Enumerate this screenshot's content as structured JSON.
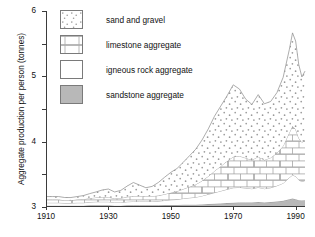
{
  "chart_data": {
    "type": "area",
    "title": "",
    "subtitle": "",
    "xlabel": "",
    "ylabel": "Aggregate production per person (tonnes)",
    "xlim": [
      1910,
      1993
    ],
    "ylim": [
      0,
      6
    ],
    "yticks": [
      0,
      1,
      2,
      3,
      4,
      5,
      6
    ],
    "xticks": [
      1910,
      1930,
      1950,
      1970,
      1990
    ],
    "xtick_labels": [
      "1910",
      "1930",
      "1950",
      "1970",
      "1990"
    ],
    "ytick_labels": [
      "0",
      "1",
      "2",
      "3",
      "4",
      "5",
      "6"
    ],
    "grid": false,
    "stacked": true,
    "legend_position": "upper-left-inside",
    "x": [
      1910,
      1912,
      1914,
      1916,
      1918,
      1920,
      1922,
      1924,
      1926,
      1928,
      1930,
      1932,
      1934,
      1936,
      1938,
      1940,
      1942,
      1944,
      1946,
      1948,
      1950,
      1952,
      1954,
      1956,
      1958,
      1960,
      1962,
      1964,
      1966,
      1968,
      1970,
      1972,
      1974,
      1976,
      1978,
      1980,
      1982,
      1984,
      1986,
      1988,
      1989,
      1990,
      1991,
      1992,
      1993
    ],
    "series": [
      {
        "name": "sandstone aggregate",
        "fill": "#b8b8b8",
        "pattern": "solid-grey",
        "order": 1,
        "values": [
          0.04,
          0.04,
          0.04,
          0.04,
          0.04,
          0.04,
          0.04,
          0.05,
          0.05,
          0.05,
          0.05,
          0.04,
          0.04,
          0.05,
          0.05,
          0.05,
          0.05,
          0.05,
          0.05,
          0.06,
          0.06,
          0.06,
          0.07,
          0.07,
          0.07,
          0.08,
          0.09,
          0.1,
          0.11,
          0.12,
          0.13,
          0.14,
          0.14,
          0.14,
          0.15,
          0.14,
          0.15,
          0.17,
          0.19,
          0.24,
          0.26,
          0.24,
          0.21,
          0.2,
          0.21
        ]
      },
      {
        "name": "igneous rock aggregate",
        "fill": "#ffffff",
        "pattern": "plain-white",
        "order": 2,
        "values": [
          0.09,
          0.09,
          0.09,
          0.08,
          0.08,
          0.09,
          0.09,
          0.1,
          0.11,
          0.11,
          0.11,
          0.1,
          0.1,
          0.11,
          0.12,
          0.12,
          0.12,
          0.12,
          0.13,
          0.14,
          0.16,
          0.17,
          0.19,
          0.21,
          0.23,
          0.26,
          0.3,
          0.34,
          0.38,
          0.42,
          0.46,
          0.46,
          0.44,
          0.42,
          0.45,
          0.42,
          0.44,
          0.48,
          0.54,
          0.66,
          0.72,
          0.7,
          0.62,
          0.58,
          0.6
        ]
      },
      {
        "name": "limestone aggregate",
        "fill": "#ffffff",
        "pattern": "brick",
        "order": 3,
        "values": [
          0.1,
          0.1,
          0.1,
          0.09,
          0.09,
          0.1,
          0.11,
          0.12,
          0.13,
          0.14,
          0.14,
          0.12,
          0.13,
          0.15,
          0.16,
          0.16,
          0.16,
          0.16,
          0.17,
          0.19,
          0.22,
          0.25,
          0.29,
          0.34,
          0.39,
          0.46,
          0.55,
          0.66,
          0.76,
          0.86,
          0.95,
          0.96,
          0.92,
          0.88,
          0.94,
          0.88,
          0.92,
          1.0,
          1.14,
          1.38,
          1.5,
          1.44,
          1.28,
          1.2,
          1.25
        ]
      },
      {
        "name": "sand and gravel",
        "fill": "#ffffff",
        "pattern": "stipple-dots",
        "order": 4,
        "values": [
          0.09,
          0.09,
          0.09,
          0.08,
          0.08,
          0.09,
          0.11,
          0.14,
          0.17,
          0.22,
          0.25,
          0.2,
          0.24,
          0.33,
          0.42,
          0.34,
          0.26,
          0.3,
          0.4,
          0.52,
          0.62,
          0.7,
          0.82,
          0.95,
          1.08,
          1.25,
          1.45,
          1.68,
          1.84,
          2.0,
          2.2,
          2.05,
          1.8,
          1.7,
          1.9,
          1.72,
          1.72,
          1.85,
          2.1,
          2.55,
          2.85,
          2.7,
          2.25,
          2.0,
          2.1
        ]
      }
    ],
    "totals_note": "values are stacked; top of stack peaks near 5.3 tonnes per person around 1989",
    "annotations": []
  },
  "legend": {
    "items": [
      {
        "label": "sand and gravel",
        "swatch": "stipple-dots"
      },
      {
        "label": "limestone aggregate",
        "swatch": "brick"
      },
      {
        "label": "igneous rock aggregate",
        "swatch": "plain-white"
      },
      {
        "label": "sandstone aggregate",
        "swatch": "solid-grey"
      }
    ]
  },
  "axes": {
    "y_title": "Aggregate production per person (tonnes)",
    "y_ticks": [
      "6",
      "5",
      "4",
      "3",
      "2",
      "1",
      "0"
    ],
    "x_ticks": [
      "1910",
      "1930",
      "1950",
      "1970",
      "1990"
    ]
  },
  "colors": {
    "axis": "#3b3b3b",
    "outline": "#8a8a8a",
    "sandstone_fill": "#b8b8b8",
    "background": "#ffffff"
  }
}
